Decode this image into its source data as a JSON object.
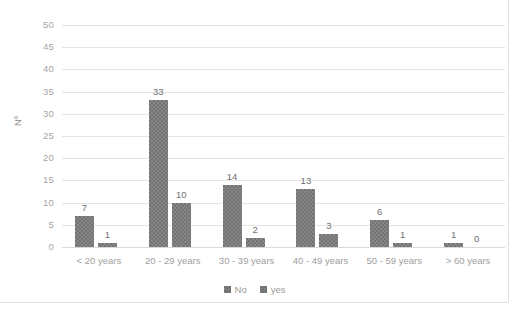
{
  "chart_data": {
    "type": "bar",
    "title": "",
    "subtitle": "",
    "xlabel": "",
    "ylabel": "Nº",
    "ylim": [
      0,
      50
    ],
    "yticks": [
      0,
      5,
      10,
      15,
      20,
      25,
      30,
      35,
      40,
      45,
      50
    ],
    "grid": true,
    "legend_position": "bottom",
    "categories": [
      "< 20 years",
      "20 - 29 years",
      "30 - 39 years",
      "40 - 49 years",
      "50 - 59 years",
      "> 60 years"
    ],
    "series": [
      {
        "name": "No",
        "values": [
          7,
          33,
          14,
          13,
          6,
          1
        ],
        "color": "#737373"
      },
      {
        "name": "yes",
        "values": [
          1,
          10,
          2,
          3,
          1,
          0
        ],
        "color": "#737373"
      }
    ],
    "data_labels": [
      [
        "7",
        "1"
      ],
      [
        "33",
        "10"
      ],
      [
        "14",
        "2"
      ],
      [
        "13",
        "3"
      ],
      [
        "6",
        "1"
      ],
      [
        "1",
        "0"
      ]
    ]
  },
  "axis": {
    "y_title": "Nº",
    "y_tick_labels": [
      "50",
      "45",
      "40",
      "35",
      "30",
      "25",
      "20",
      "15",
      "10",
      "5",
      "0"
    ],
    "x_tick_labels": [
      "< 20 years",
      "20 - 29 years",
      "30 - 39 years",
      "40 - 49 years",
      "50 - 59 years",
      "> 60 years"
    ]
  },
  "legend": {
    "items": [
      {
        "label": "No"
      },
      {
        "label": "yes"
      }
    ]
  }
}
